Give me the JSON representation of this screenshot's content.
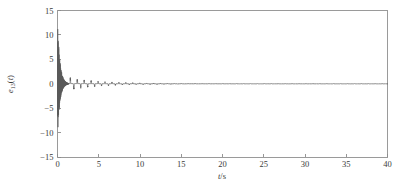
{
  "figure": {
    "name": "error-signal-time-response",
    "background_color": "#ffffff",
    "trace_color": "#5a5a5a",
    "frame_color": "#9a9a9a",
    "label_color": "#3a3a3a"
  },
  "axes": {
    "x": {
      "label_main": "t",
      "label_unit": "/s",
      "label_full": "t/s",
      "ticks": [
        0,
        5,
        10,
        15,
        20,
        25,
        30,
        35,
        40
      ],
      "tick_labels": [
        "0",
        "5",
        "10",
        "15",
        "20",
        "25",
        "30",
        "35",
        "40"
      ],
      "min": 0,
      "max": 40
    },
    "y": {
      "label_base": "e",
      "label_subscript": "13",
      "label_arg": "(t)",
      "label_full": "e13(t)",
      "ticks": [
        15,
        10,
        5,
        0,
        -5,
        -10,
        -15
      ],
      "tick_labels": [
        "15",
        "10",
        "5",
        "0",
        "-5",
        "-10",
        "-15"
      ],
      "min": -15,
      "max": 15
    }
  },
  "chart_data": {
    "type": "line",
    "title": "",
    "subtitle": "",
    "xlabel": "t/s",
    "ylabel": "e13(t)",
    "xlim": [
      0,
      40
    ],
    "ylim": [
      -15,
      15
    ],
    "xticks": [
      0,
      5,
      10,
      15,
      20,
      25,
      30,
      35,
      40
    ],
    "yticks": [
      15,
      10,
      5,
      0,
      -5,
      -10,
      -15
    ],
    "grid": false,
    "legend": false,
    "legend_position": "none",
    "series": [
      {
        "name": "e13(t)",
        "color": "#5a5a5a",
        "description": "Synchronization error: large high-frequency transient burst near t=0 decaying rapidly, followed by small periodic residual spikes that vanish by about t=20 s.",
        "envelope_model": {
          "burst": {
            "t_start": 0.0,
            "t_end": 1.35,
            "peak_positive": 13.2,
            "peak_negative": -11.0,
            "oscillation_frequency_hz": 46,
            "decay_rate": 3.4
          },
          "residual": {
            "t_start": 1.35,
            "t_end": 40.0,
            "spike_amplitude_initial": 1.1,
            "spike_amplitude_final": 0.03,
            "spike_period_s": 0.42,
            "decay_rate": 0.26
          }
        },
        "sampled_points": [
          {
            "t": 0.0,
            "y": 0.0
          },
          {
            "t": 0.04,
            "y": 13.2
          },
          {
            "t": 0.09,
            "y": -10.6
          },
          {
            "t": 0.14,
            "y": 11.4
          },
          {
            "t": 0.19,
            "y": -10.9
          },
          {
            "t": 0.25,
            "y": 9.8
          },
          {
            "t": 0.31,
            "y": -9.2
          },
          {
            "t": 0.38,
            "y": 8.4
          },
          {
            "t": 0.45,
            "y": -8.1
          },
          {
            "t": 0.53,
            "y": 7.0
          },
          {
            "t": 0.62,
            "y": -6.5
          },
          {
            "t": 0.72,
            "y": 5.4
          },
          {
            "t": 0.82,
            "y": -4.8
          },
          {
            "t": 0.93,
            "y": 3.6
          },
          {
            "t": 1.05,
            "y": -3.0
          },
          {
            "t": 1.18,
            "y": 2.1
          },
          {
            "t": 1.32,
            "y": -1.6
          },
          {
            "t": 1.6,
            "y": 1.0
          },
          {
            "t": 2.1,
            "y": -0.8
          },
          {
            "t": 2.8,
            "y": 0.9
          },
          {
            "t": 3.6,
            "y": -0.7
          },
          {
            "t": 4.5,
            "y": 0.8
          },
          {
            "t": 5.5,
            "y": -0.7
          },
          {
            "t": 6.5,
            "y": 0.9
          },
          {
            "t": 7.5,
            "y": -0.8
          },
          {
            "t": 8.5,
            "y": 0.8
          },
          {
            "t": 9.5,
            "y": -0.6
          },
          {
            "t": 10.5,
            "y": 0.5
          },
          {
            "t": 12.0,
            "y": -0.4
          },
          {
            "t": 14.0,
            "y": 0.35
          },
          {
            "t": 16.0,
            "y": -0.2
          },
          {
            "t": 18.0,
            "y": 0.25
          },
          {
            "t": 20.0,
            "y": -0.12
          },
          {
            "t": 24.0,
            "y": 0.08
          },
          {
            "t": 28.0,
            "y": -0.05
          },
          {
            "t": 32.0,
            "y": 0.04
          },
          {
            "t": 36.0,
            "y": -0.03
          },
          {
            "t": 40.0,
            "y": 0.02
          }
        ]
      }
    ]
  }
}
